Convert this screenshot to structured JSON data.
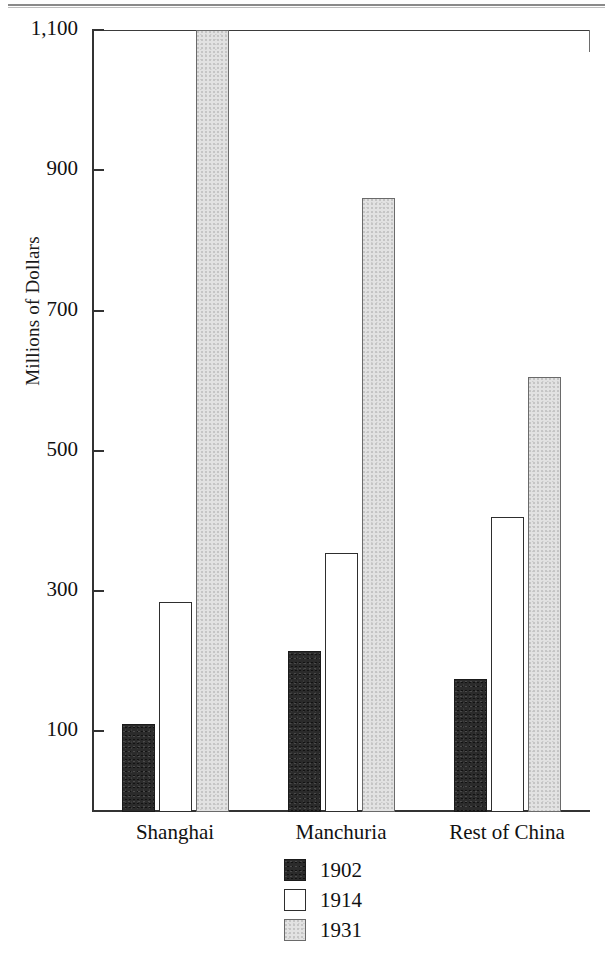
{
  "figure": {
    "page_rule": "horizontal-rule",
    "background_color": "#ffffff"
  },
  "chart_data": {
    "type": "bar",
    "title": "",
    "xlabel": "",
    "ylabel": "Millions of Dollars",
    "categories": [
      "Shanghai",
      "Manchuria",
      "Rest of China"
    ],
    "series": [
      {
        "name": "1902",
        "color": "#2b2b2b",
        "values": [
          110,
          215,
          175
        ]
      },
      {
        "name": "1914",
        "color": "#ffffff",
        "values": [
          285,
          355,
          405
        ]
      },
      {
        "name": "1931",
        "color": "#e2e2e2",
        "values": [
          1100,
          860,
          605
        ]
      }
    ],
    "ylim": [
      -15,
      1100
    ],
    "yticks": [
      100,
      300,
      500,
      700,
      900,
      1100
    ],
    "ytick_labels": [
      "100",
      "300",
      "500",
      "700",
      "900",
      "1,100"
    ],
    "grid": false,
    "legend_position": "bottom-center"
  },
  "axis": {
    "y_title": "Millions of Dollars"
  },
  "legend": {
    "entries": [
      {
        "label": "1902",
        "swatch": "black-stippled"
      },
      {
        "label": "1914",
        "swatch": "white-outline"
      },
      {
        "label": "1931",
        "swatch": "light-gray-stippled"
      }
    ]
  }
}
